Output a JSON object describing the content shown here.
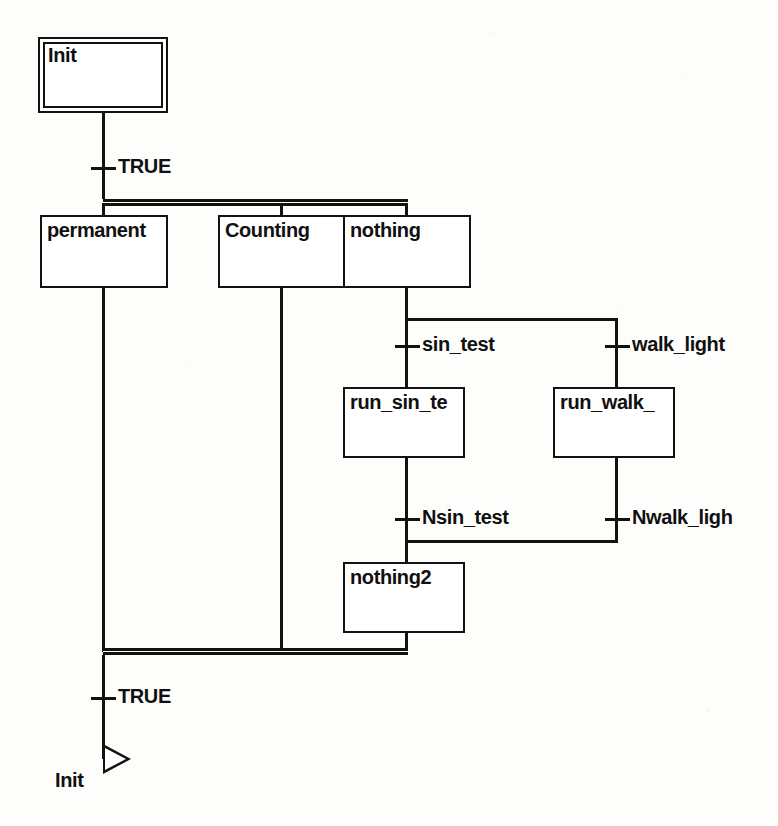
{
  "diagram": {
    "type": "sequential-function-chart",
    "background_color": "#fdfdfc",
    "line_color": "#14120f",
    "steps": [
      {
        "id": "init",
        "label": "Init",
        "kind": "initial",
        "x": 38,
        "y": 37,
        "w": 130,
        "h": 76
      },
      {
        "id": "permanent",
        "label": "permanent",
        "kind": "normal",
        "x": 40,
        "y": 215,
        "w": 128,
        "h": 73
      },
      {
        "id": "counting",
        "label": "Counting",
        "kind": "normal",
        "x": 218,
        "y": 215,
        "w": 128,
        "h": 73
      },
      {
        "id": "nothing",
        "label": "nothing",
        "kind": "normal",
        "x": 343,
        "y": 215,
        "w": 128,
        "h": 73
      },
      {
        "id": "run_sin_te",
        "label": "run_sin_te",
        "kind": "normal",
        "x": 343,
        "y": 387,
        "w": 122,
        "h": 71
      },
      {
        "id": "run_walk",
        "label": "run_walk_",
        "kind": "normal",
        "x": 553,
        "y": 387,
        "w": 122,
        "h": 71
      },
      {
        "id": "nothing2",
        "label": "nothing2",
        "kind": "normal",
        "x": 343,
        "y": 562,
        "w": 122,
        "h": 71
      }
    ],
    "transitions": [
      {
        "id": "t-init",
        "label": "TRUE",
        "tick_x": 91,
        "tick_y": 167
      },
      {
        "id": "t-sin",
        "label": "sin_test",
        "tick_x": 395,
        "tick_y": 345
      },
      {
        "id": "t-walk",
        "label": "walk_light",
        "tick_x": 605,
        "tick_y": 345
      },
      {
        "id": "t-nsin",
        "label": "Nsin_test",
        "tick_x": 395,
        "tick_y": 518
      },
      {
        "id": "t-nwalk",
        "label": "Nwalk_ligh",
        "tick_x": 605,
        "tick_y": 518
      },
      {
        "id": "t-bottom",
        "label": "TRUE",
        "tick_x": 91,
        "tick_y": 697
      }
    ],
    "jump": {
      "label": "Init",
      "arrow_x": 103,
      "arrow_y": 754,
      "label_x": 55,
      "label_y": 779
    },
    "parallel_bars": [
      {
        "id": "divergence-bar",
        "x": 103,
        "y": 199,
        "w": 305
      },
      {
        "id": "convergence-bar",
        "x": 103,
        "y": 648,
        "w": 305
      }
    ]
  }
}
